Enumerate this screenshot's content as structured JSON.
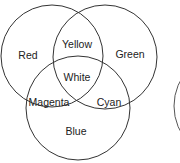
{
  "diagram": {
    "type": "venn-additive-color",
    "stroke_color": "#333333",
    "circles": [
      {
        "name": "Red",
        "cx": 52,
        "cy": 56,
        "r": 51
      },
      {
        "name": "Green",
        "cx": 105,
        "cy": 57,
        "r": 52
      },
      {
        "name": "Blue",
        "cx": 78,
        "cy": 108,
        "r": 52
      }
    ],
    "labels": {
      "red": "Red",
      "green": "Green",
      "blue": "Blue",
      "yellow": "Yellow",
      "magenta": "Magenta",
      "cyan": "Cyan",
      "white": "White"
    },
    "partial_circle": {
      "cx": 228,
      "cy": 106,
      "r": 54
    }
  }
}
